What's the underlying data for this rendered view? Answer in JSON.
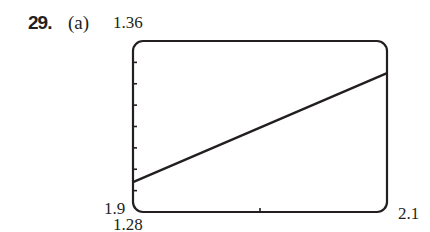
{
  "problem": {
    "number": "29.",
    "part": "(a)"
  },
  "window": {
    "ymax_label": "1.36",
    "ymin_label": "1.28",
    "xmin_label": "1.9",
    "xmax_label": "2.1"
  },
  "chart_data": {
    "type": "line",
    "title": "",
    "xlabel": "",
    "ylabel": "",
    "xlim": [
      1.9,
      2.1
    ],
    "ylim": [
      1.28,
      1.36
    ],
    "x_ticks": [
      2.0
    ],
    "y_ticks": [
      1.29,
      1.3,
      1.31,
      1.32,
      1.33,
      1.34,
      1.35
    ],
    "grid": false,
    "series": [
      {
        "name": "graph",
        "x": [
          1.9,
          2.1
        ],
        "y": [
          1.294,
          1.345
        ]
      }
    ],
    "colors": {
      "line": "#231f20",
      "frame": "#231f20",
      "background": "#ffffff"
    }
  }
}
